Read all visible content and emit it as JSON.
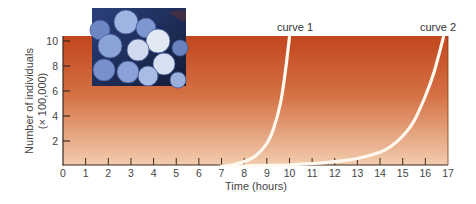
{
  "chart_data": {
    "type": "line",
    "title": "",
    "xlabel": "Time (hours)",
    "ylabel": "Number of individuals",
    "ylabel_sub": "(× 100,000)",
    "xlim": [
      0,
      17
    ],
    "ylim": [
      0,
      10.5
    ],
    "x_ticks": [
      0,
      1,
      2,
      3,
      4,
      5,
      6,
      7,
      8,
      9,
      10,
      11,
      12,
      13,
      14,
      15,
      16,
      17
    ],
    "y_ticks": [
      2,
      4,
      6,
      8,
      10
    ],
    "grid": false,
    "legend": "inline labels at curve tops",
    "series": [
      {
        "name": "curve 1",
        "x": [
          7.0,
          7.5,
          8.0,
          8.5,
          9.0,
          9.3,
          9.6,
          9.8,
          10.0
        ],
        "values": [
          0.0,
          0.1,
          0.35,
          0.8,
          1.8,
          3.0,
          5.0,
          7.3,
          10.4
        ]
      },
      {
        "name": "curve 2",
        "x": [
          7.5,
          9,
          10,
          11,
          12,
          13,
          14,
          14.5,
          15,
          15.5,
          16,
          16.4,
          16.8
        ],
        "values": [
          0.0,
          0.05,
          0.1,
          0.2,
          0.35,
          0.6,
          1.1,
          1.6,
          2.4,
          3.6,
          5.6,
          7.6,
          10.4
        ]
      }
    ],
    "annotations": [
      "curve 1",
      "curve 2"
    ],
    "background": "gradient from dark orange-red (top) to pale peach (bottom)"
  },
  "labels": {
    "curve1": "curve 1",
    "curve2": "curve 2",
    "xlabel": "Time (hours)",
    "ylabel_line1": "Number of individuals",
    "ylabel_line2": "(× 100,000)"
  },
  "image": {
    "description": "micrograph of spherical bacteria cluster (blue tones)"
  },
  "colors": {
    "plot_top": "#c2461d",
    "plot_mid": "#d9794a",
    "plot_bottom": "#f0c4a4",
    "curve": "#fff8ee",
    "axis": "#3a2a20"
  }
}
